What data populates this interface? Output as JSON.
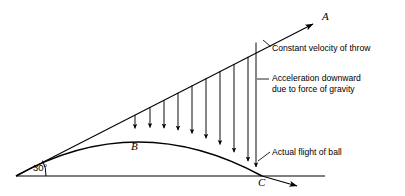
{
  "figure": {
    "type": "physics-projectile-diagram",
    "background_color": "#ffffff",
    "stroke_color": "#000000"
  },
  "callouts": [
    {
      "id": "constant-velocity",
      "text": "Constant velocity of throw",
      "x": 272,
      "y": 43,
      "leader": {
        "x1": 263,
        "y1": 40,
        "x2": 270,
        "y2": 46
      }
    },
    {
      "id": "acceleration-downward",
      "line1": "Acceleration downward",
      "line2": "due to force of gravity",
      "x": 272,
      "y": 73,
      "leader": {
        "x1": 257,
        "y1": 79,
        "x2": 269,
        "y2": 79
      }
    },
    {
      "id": "actual-flight",
      "text": "Actual flight of ball",
      "x": 272,
      "y": 148,
      "leader": {
        "x1": 258,
        "y1": 160,
        "x2": 270,
        "y2": 152
      }
    }
  ],
  "point_labels": [
    {
      "id": "point-a",
      "text": "A",
      "x": 322,
      "y": 10
    },
    {
      "id": "point-b",
      "text": "B",
      "x": 131,
      "y": 140
    },
    {
      "id": "point-c",
      "text": "C",
      "x": 258,
      "y": 176
    }
  ],
  "angle": {
    "id": "launch-angle",
    "text": "30°",
    "value": 30,
    "unit": "degrees",
    "x": 33,
    "y": 163
  },
  "geometry": {
    "origin": {
      "x": 16,
      "y": 176
    },
    "ground_line": {
      "x1": 16,
      "y1": 176,
      "x2": 325,
      "y2": 176
    },
    "velocity_line": {
      "x1": 16,
      "y1": 176,
      "x2": 318,
      "y2": 21
    },
    "velocity_arrow_tip": {
      "x": 318,
      "y": 21
    },
    "trajectory_arrow_tip": {
      "x": 302,
      "y": 189
    },
    "apex": {
      "x": 138,
      "y": 132
    },
    "landing": {
      "x": 262,
      "y": 176
    },
    "angle_arc_radius": 26,
    "gravity_arrow_x_positions": [
      135,
      150,
      164,
      178,
      192,
      206,
      220,
      234,
      248,
      256
    ]
  }
}
